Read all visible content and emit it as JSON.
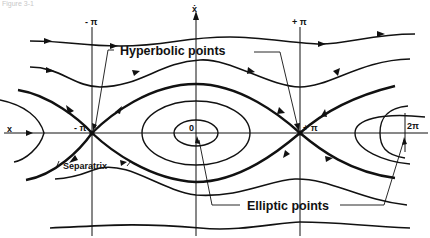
{
  "figure": {
    "caption": "Figure 3-1"
  },
  "axes": {
    "horizontal_label": "x",
    "vertical_label": "ẋ",
    "tick_labels": {
      "neg_pi_top": "- π",
      "pos_pi_top": "+ π",
      "neg_pi_axis": "- π",
      "pos_pi_axis": "+ π",
      "origin": "0",
      "two_pi": "2π"
    }
  },
  "annotations": {
    "hyperbolic": "Hyperbolic  points",
    "elliptic": "Elliptic  points",
    "separatrix": "Separatrix"
  },
  "colors": {
    "ink": "#111111",
    "background": "#ffffff"
  }
}
